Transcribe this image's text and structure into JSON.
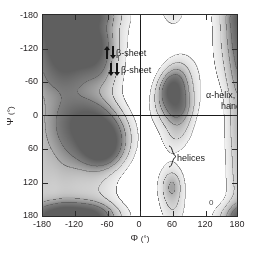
{
  "figure": {
    "type": "ramachandran-plot",
    "background": "#ffffff"
  },
  "axes": {
    "x": {
      "title": "Φ",
      "unit": "(°)",
      "min": -180,
      "max": 180,
      "ticks": [
        -180,
        -120,
        -60,
        0,
        60,
        120,
        180
      ],
      "ticklabels": [
        "-180",
        "-120",
        "-60",
        "0",
        "60",
        "120",
        "180"
      ]
    },
    "y": {
      "title": "Ψ",
      "unit": "(°)",
      "min": -180,
      "max": 180,
      "ticks": [
        -180,
        -120,
        -60,
        0,
        60,
        120,
        180
      ],
      "ticklabels": [
        "-180",
        "-120",
        "-60",
        "0",
        "60",
        "120",
        "180"
      ]
    },
    "zero_lines": true,
    "frame_color": "#2b2b2b"
  },
  "annotations": {
    "beta_antiparallel": {
      "text": "β-sheet",
      "icon": "antiparallel-arrows-icon",
      "phi": -118,
      "psi": 140
    },
    "beta_parallel": {
      "text": "β-sheet",
      "icon": "parallel-arrows-icon",
      "phi": -108,
      "psi": 110
    },
    "left_handed_helix": {
      "line1": "α-helix, left-",
      "line2": "handed",
      "phi": 62,
      "psi": 40
    },
    "helix_types": {
      "three_ten": "3",
      "three_ten_sub": "10",
      "alpha": "α",
      "helices": "helices",
      "phi": -62,
      "psi": -45
    },
    "lower_right_blob": {
      "text": "0",
      "phi": 58,
      "psi": -128
    }
  },
  "chart_data": {
    "type": "heatmap",
    "title": "",
    "subtitle": "",
    "xlabel": "Φ (°)",
    "ylabel": "Ψ (°)",
    "xlim": [
      -180,
      180
    ],
    "ylim": [
      -180,
      180
    ],
    "grid": false,
    "legend": "none",
    "colormap": "grayscale-inverted",
    "contour_levels": [
      0.08,
      0.22,
      0.45,
      0.7
    ],
    "level_fills": [
      "#f1f1f1",
      "#d6d6d6",
      "#aaaaaa",
      "#7d7d7d"
    ],
    "contour_line_color": "#555555",
    "regions": [
      {
        "name": "beta-sheet",
        "label": "β-sheet",
        "phi_center": -120,
        "psi_center": 135,
        "phi_range": [
          -180,
          -45
        ],
        "psi_range": [
          60,
          180
        ],
        "peak_density": 1.0
      },
      {
        "name": "alpha-helix-right-handed",
        "label": "3_10 / α helices",
        "phi_center": -63,
        "psi_center": -43,
        "phi_range": [
          -160,
          -40
        ],
        "psi_range": [
          -75,
          30
        ],
        "peak_density": 0.95
      },
      {
        "name": "alpha-helix-left-handed",
        "label": "α-helix, left-handed",
        "phi_center": 62,
        "psi_center": 35,
        "phi_range": [
          35,
          95
        ],
        "psi_range": [
          -15,
          85
        ],
        "peak_density": 0.72
      },
      {
        "name": "bridge-lower-right",
        "label": "0",
        "phi_center": 60,
        "psi_center": -128,
        "phi_range": [
          35,
          95
        ],
        "psi_range": [
          -180,
          -95
        ],
        "peak_density": 0.28
      },
      {
        "name": "beta-sheet-lower-wrap",
        "label": "",
        "phi_center": -120,
        "psi_center": -178,
        "phi_range": [
          -180,
          -55
        ],
        "psi_range": [
          -180,
          -160
        ],
        "peak_density": 0.5
      },
      {
        "name": "right-edge-wrap",
        "label": "",
        "phi_center": 180,
        "psi_center": 0,
        "phi_range": [
          168,
          180
        ],
        "psi_range": [
          -180,
          180
        ],
        "peak_density": 0.1
      }
    ]
  }
}
